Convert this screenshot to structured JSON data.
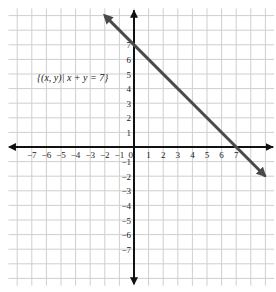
{
  "figure": {
    "title": "",
    "annotation": "{(x, y)| x + y = 7}",
    "background_color": "#ffffff",
    "grid_color": "#cfcfcf",
    "axis_color": "#111111",
    "line_color": "#4a4a4a"
  },
  "axes": {
    "x_tick_labels": [
      "-7",
      "-6",
      "-5",
      "-4",
      "-3",
      "-2",
      "-1",
      "1",
      "2",
      "3",
      "4",
      "5",
      "6",
      "7"
    ],
    "y_tick_labels": [
      "7",
      "6",
      "5",
      "4",
      "3",
      "2",
      "1",
      "-1",
      "-2",
      "-3",
      "-4",
      "-5",
      "-6",
      "-7"
    ],
    "origin_label": "0"
  },
  "chart_data": {
    "type": "line",
    "title": "",
    "xlabel": "x",
    "ylabel": "y",
    "xlim": [
      -8.6,
      9.6
    ],
    "ylim": [
      -9.5,
      9.5
    ],
    "grid": true,
    "grid_step": 1,
    "legend": "none",
    "annotations": [
      {
        "text": "{(x, y)| x + y = 7}",
        "x": -4.2,
        "y": 4.5
      }
    ],
    "series": [
      {
        "name": "{(x, y)| x + y = 7}",
        "equation": "x + y = 7",
        "slope": -1,
        "y_intercept": 7,
        "x_intercept": 7,
        "arrow_start": true,
        "arrow_end": true,
        "x": [
          -2,
          9
        ],
        "y": [
          9,
          -2
        ],
        "points": [
          {
            "x": 0,
            "y": 7
          },
          {
            "x": 7,
            "y": 0
          }
        ]
      }
    ],
    "x_ticks": [
      -7,
      -6,
      -5,
      -4,
      -3,
      -2,
      -1,
      0,
      1,
      2,
      3,
      4,
      5,
      6,
      7
    ],
    "y_ticks": [
      -7,
      -6,
      -5,
      -4,
      -3,
      -2,
      -1,
      0,
      1,
      2,
      3,
      4,
      5,
      6,
      7
    ]
  }
}
